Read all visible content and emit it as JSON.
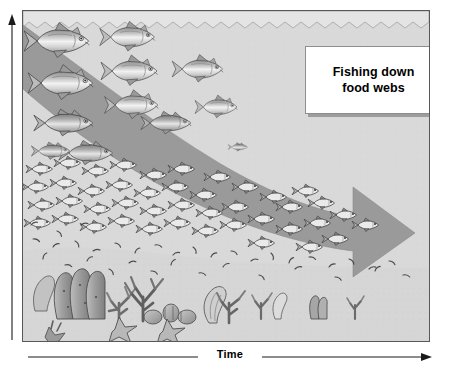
{
  "figure": {
    "title_note": "Fishing down food webs conceptual diagram",
    "panel": {
      "background_color": "#d9d9d9",
      "border_color": "#585858",
      "water_surface": "wavy-line",
      "arrow": {
        "name": "fishing-down-arrow",
        "direction": "right",
        "fill_color": "#9a9a9a",
        "meaning": "shift of fishery catch from large predators to small fish and invertebrates over time"
      }
    },
    "callout": {
      "line1": "Fishing down",
      "line2": "food webs",
      "text": "Fishing down food webs",
      "background_color": "#ffffff",
      "shadow_color": "#9d9d9d"
    },
    "axes": {
      "x": {
        "label": "Time",
        "arrow": "right",
        "name": "time-axis"
      },
      "y": {
        "label": "",
        "arrow": "up",
        "name": "trophic-level-axis"
      }
    },
    "scene_elements": [
      {
        "group": "large-predatory-fish",
        "zone": "upper-left",
        "count_label": "many"
      },
      {
        "group": "medium-fish",
        "zone": "mid-left",
        "count_label": "several"
      },
      {
        "group": "small-schooling-fish",
        "zone": "arrow-body",
        "count_label": "dense school"
      },
      {
        "group": "plankton-invertebrates",
        "zone": "lower-middle",
        "count_label": "scattered specks"
      },
      {
        "group": "sponges-corals-starfish",
        "zone": "seafloor-left",
        "count_label": "abundant reef"
      },
      {
        "group": "small-corals",
        "zone": "seafloor-right",
        "count_label": "sparse remnants"
      }
    ]
  }
}
